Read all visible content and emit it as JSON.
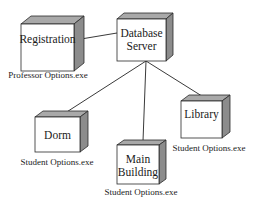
{
  "diagram": {
    "type": "deployment-diagram",
    "colors": {
      "front": "#ffffff",
      "top": "#a9a9a9",
      "side": "#8c8c8c",
      "stroke": "#2a2a2a",
      "line": "#3a3a3a"
    },
    "nodes": [
      {
        "id": "registration",
        "lines": [
          "Registration"
        ],
        "label": "Professor Options.exe",
        "front": {
          "x": 21,
          "y": 24,
          "w": 53,
          "h": 47
        },
        "depth": {
          "dx": 10,
          "dy": -8
        },
        "text_y": [
          40
        ],
        "label_pos": {
          "x": 48,
          "y": 76
        }
      },
      {
        "id": "database-server",
        "lines": [
          "Database",
          "Server"
        ],
        "label": "",
        "front": {
          "x": 117,
          "y": 19,
          "w": 49,
          "h": 42
        },
        "depth": {
          "dx": 7,
          "dy": -6
        },
        "text_y": [
          34,
          47
        ],
        "label_pos": null
      },
      {
        "id": "dorm",
        "lines": [
          "Dorm"
        ],
        "label": "Student Options.exe",
        "front": {
          "x": 35,
          "y": 117,
          "w": 45,
          "h": 35
        },
        "depth": {
          "dx": 8,
          "dy": -6
        },
        "text_y": [
          136
        ],
        "label_pos": {
          "x": 57,
          "y": 163
        }
      },
      {
        "id": "main-building",
        "lines": [
          "Main",
          "Building"
        ],
        "label": "Student Options.exe",
        "front": {
          "x": 117,
          "y": 145,
          "w": 42,
          "h": 39
        },
        "depth": {
          "dx": 7,
          "dy": -5
        },
        "text_y": [
          160,
          173
        ],
        "label_pos": {
          "x": 141,
          "y": 193
        }
      },
      {
        "id": "library",
        "lines": [
          "Library"
        ],
        "label": "Student Options.exe",
        "front": {
          "x": 181,
          "y": 101,
          "w": 41,
          "h": 37
        },
        "depth": {
          "dx": 8,
          "dy": -6
        },
        "text_y": [
          115
        ],
        "label_pos": {
          "x": 209,
          "y": 149
        }
      }
    ],
    "connections": [
      {
        "from": "registration",
        "to": "database-server",
        "x1": 81,
        "y1": 39,
        "x2": 117,
        "y2": 33
      },
      {
        "from": "database-server",
        "to": "dorm",
        "x1": 146,
        "y1": 61,
        "x2": 62,
        "y2": 115
      },
      {
        "from": "database-server",
        "to": "main-building",
        "x1": 146,
        "y1": 61,
        "x2": 143,
        "y2": 141
      },
      {
        "from": "database-server",
        "to": "library",
        "x1": 146,
        "y1": 61,
        "x2": 205,
        "y2": 98
      }
    ]
  }
}
